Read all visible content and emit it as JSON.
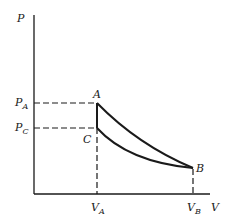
{
  "diagram": {
    "type": "P-V thermodynamic diagram",
    "axes": {
      "y_label": "P",
      "x_label": "V"
    },
    "points": [
      {
        "name": "A",
        "label": "A",
        "volume": "V_A",
        "pressure": "P_A"
      },
      {
        "name": "B",
        "label": "B",
        "volume": "V_B",
        "pressure": ""
      },
      {
        "name": "C",
        "label": "C",
        "volume": "V_A",
        "pressure": "P_C"
      }
    ],
    "tick_labels": {
      "p_a": {
        "main": "P",
        "sub": "A"
      },
      "p_c": {
        "main": "P",
        "sub": "C"
      },
      "v_a": {
        "main": "V",
        "sub": "A"
      },
      "v_b": {
        "main": "V",
        "sub": "B"
      }
    },
    "paths": [
      {
        "from": "A",
        "to": "B",
        "style": "solid curve"
      },
      {
        "from": "C",
        "to": "B",
        "style": "solid curve"
      },
      {
        "from": "A",
        "to": "C",
        "style": "solid vertical"
      }
    ],
    "guides": [
      {
        "from": "P_A axis",
        "to": "A",
        "style": "dashed"
      },
      {
        "from": "P_C axis",
        "to": "C",
        "style": "dashed"
      },
      {
        "from": "C",
        "to": "V_A axis",
        "style": "dashed"
      },
      {
        "from": "B",
        "to": "V_B axis",
        "style": "dashed"
      }
    ],
    "colors": {
      "ink": "#1a1a1a",
      "background": "#ffffff"
    }
  }
}
